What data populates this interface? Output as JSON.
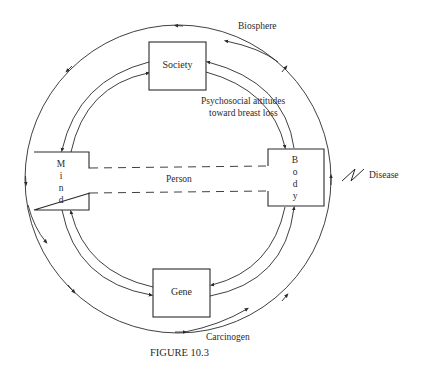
{
  "figure": {
    "caption": "FIGURE 10.3",
    "nodes": {
      "society": "Society",
      "mind": [
        "M",
        "i",
        "n",
        "d"
      ],
      "body": [
        "B",
        "o",
        "d",
        "y"
      ],
      "gene": "Gene"
    },
    "labels": {
      "biosphere": "Biosphere",
      "psychosocial_line1": "Psychosocial attitudes",
      "psychosocial_line2": "toward breast loss",
      "person": "Person",
      "disease": "Disease",
      "carcinogen": "Carcinogen"
    },
    "colors": {
      "line": "#2a2a2a",
      "background": "#ffffff"
    }
  }
}
